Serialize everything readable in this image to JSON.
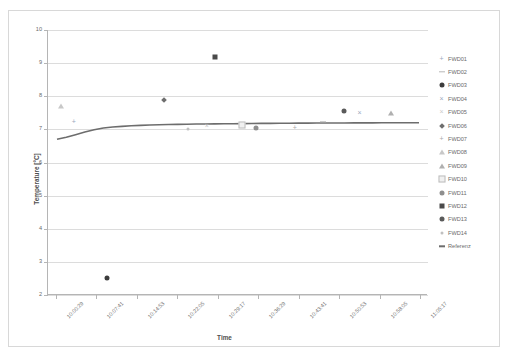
{
  "chart_data": {
    "type": "scatter",
    "title": "",
    "xlabel": "Time",
    "ylabel": "Temperature [°C]",
    "ylim": [
      2,
      10
    ],
    "yticks": [
      2,
      3,
      4,
      5,
      6,
      7,
      8,
      9,
      10
    ],
    "grid": true,
    "legend_position": "right",
    "xticks": [
      "10:00:29",
      "10:07:41",
      "10:14:53",
      "10:22:05",
      "10:29:17",
      "10:36:29",
      "10:43:41",
      "10:50:53",
      "10:58:05",
      "11:05:17"
    ],
    "series": [
      {
        "name": "FWD01",
        "marker": "plus",
        "color": "#9aa8bd",
        "points": [
          {
            "x": "10:03:40",
            "y": 7.21
          }
        ]
      },
      {
        "name": "FWD02",
        "marker": "dash",
        "color": "#b8b8b8",
        "points": [
          {
            "x": "10:48:00",
            "y": 7.22
          }
        ]
      },
      {
        "name": "FWD03",
        "marker": "circle",
        "color": "#3c3c3c",
        "points": [
          {
            "x": "10:09:30",
            "y": 2.5
          }
        ]
      },
      {
        "name": "FWD04",
        "marker": "x",
        "color": "#9aa8bd",
        "points": [
          {
            "x": "10:54:30",
            "y": 7.5
          }
        ]
      },
      {
        "name": "FWD05",
        "marker": "x-light",
        "color": "#cbcbcb",
        "points": [
          {
            "x": "10:27:20",
            "y": 7.1
          }
        ]
      },
      {
        "name": "FWD06",
        "marker": "diamond",
        "color": "#6e6e6e",
        "points": [
          {
            "x": "10:19:40",
            "y": 7.9
          }
        ]
      },
      {
        "name": "FWD07",
        "marker": "plus",
        "color": "#a9a9a9",
        "points": [
          {
            "x": "10:43:00",
            "y": 7.05
          }
        ]
      },
      {
        "name": "FWD08",
        "marker": "triangle",
        "color": "#c8c8c8",
        "points": [
          {
            "x": "10:01:20",
            "y": 7.7
          }
        ]
      },
      {
        "name": "FWD09",
        "marker": "triangle",
        "color": "#b0b0b0",
        "points": [
          {
            "x": "11:00:10",
            "y": 7.5
          }
        ]
      },
      {
        "name": "FWD10",
        "marker": "square-open",
        "color": "#bdbdbd",
        "points": [
          {
            "x": "10:33:40",
            "y": 7.12
          }
        ]
      },
      {
        "name": "FWD11",
        "marker": "circle",
        "color": "#8e8e8e",
        "points": [
          {
            "x": "10:36:10",
            "y": 7.05
          }
        ]
      },
      {
        "name": "FWD12",
        "marker": "square",
        "color": "#4a4a4a",
        "points": [
          {
            "x": "10:28:50",
            "y": 9.2
          }
        ]
      },
      {
        "name": "FWD13",
        "marker": "circle",
        "color": "#5a5a5a",
        "points": [
          {
            "x": "10:51:40",
            "y": 7.55
          }
        ]
      },
      {
        "name": "FWD14",
        "marker": "dot-small",
        "color": "#c0c0c0",
        "points": [
          {
            "x": "10:24:00",
            "y": 7.0
          }
        ]
      },
      {
        "name": "Referenz",
        "marker": "line",
        "color": "#6d6d6d",
        "description": "continuous trace rising from 6.70 to 7.20",
        "values": [
          6.7,
          6.76,
          6.84,
          6.92,
          6.99,
          7.04,
          7.07,
          7.09,
          7.11,
          7.12,
          7.13,
          7.14,
          7.145,
          7.15,
          7.155,
          7.16,
          7.163,
          7.166,
          7.17,
          7.172,
          7.175,
          7.177,
          7.18,
          7.182,
          7.184,
          7.186,
          7.188,
          7.19,
          7.191,
          7.192,
          7.193,
          7.194,
          7.195,
          7.196,
          7.197,
          7.198,
          7.199,
          7.2,
          7.2,
          7.2
        ]
      }
    ]
  },
  "legend": {
    "items": [
      {
        "label": "FWD01"
      },
      {
        "label": "FWD02"
      },
      {
        "label": "FWD03"
      },
      {
        "label": "FWD04"
      },
      {
        "label": "FWD05"
      },
      {
        "label": "FWD06"
      },
      {
        "label": "FWD07"
      },
      {
        "label": "FWD08"
      },
      {
        "label": "FWD09"
      },
      {
        "label": "FWD10"
      },
      {
        "label": "FWD11"
      },
      {
        "label": "FWD12"
      },
      {
        "label": "FWD13"
      },
      {
        "label": "FWD14"
      },
      {
        "label": "Referenz"
      }
    ]
  },
  "colors": {
    "grid": "#dcdcdc",
    "axis": "#b5b5b5",
    "text": "#6a6a6a",
    "trace": "#6d6d6d"
  }
}
